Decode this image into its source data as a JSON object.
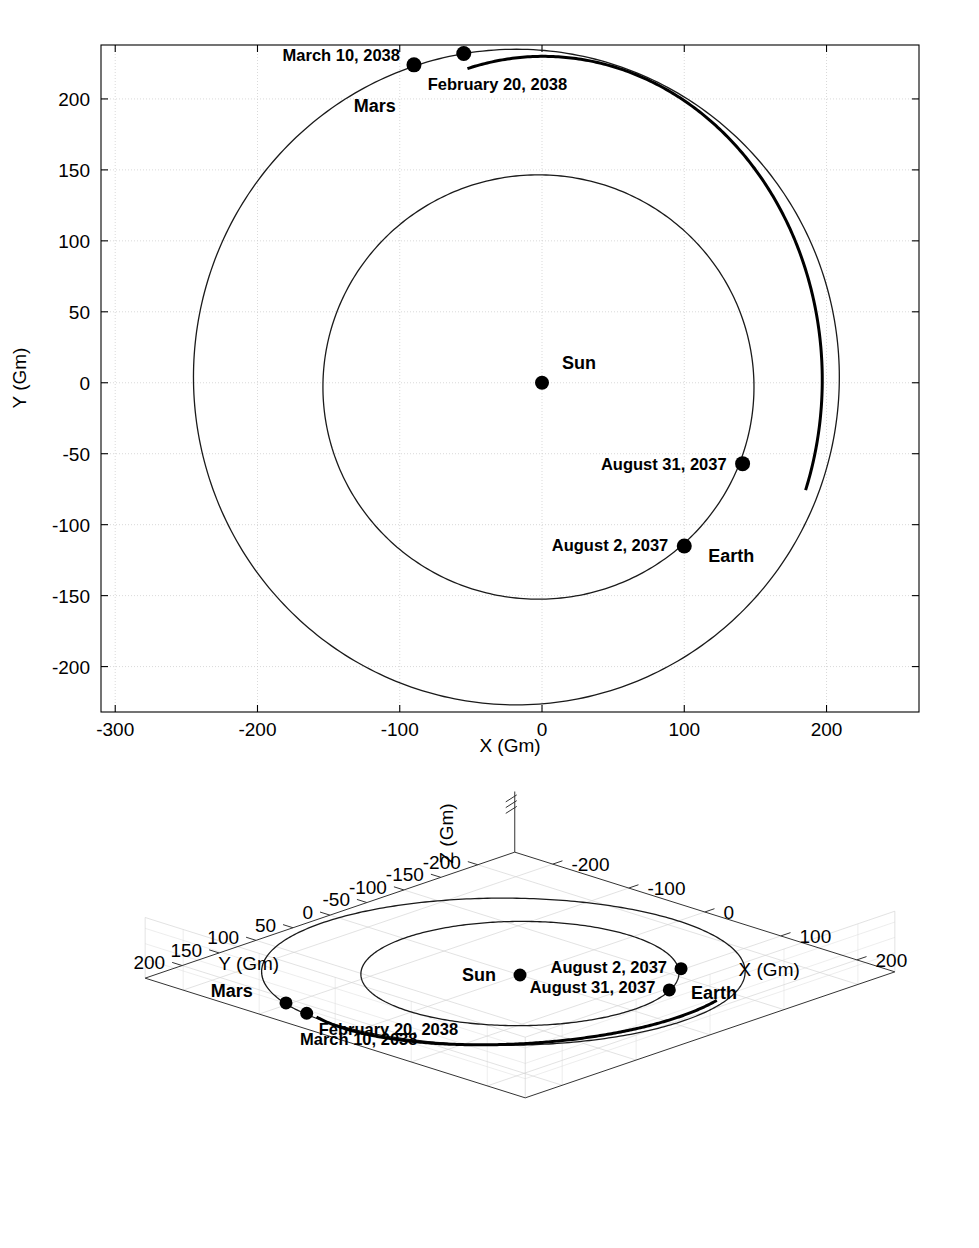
{
  "figure": {
    "background": "#ffffff",
    "line_color": "#1a1a1a",
    "grid_color": "#c8c8c8"
  },
  "chart_data": [
    {
      "id": "top-plot",
      "type": "scatter",
      "view": "2d-xy",
      "title": "",
      "xlabel": "X (Gm)",
      "ylabel": "Y (Gm)",
      "xlim": [
        -310,
        265
      ],
      "ylim": [
        -232,
        238
      ],
      "xticks": [
        -300,
        -200,
        -100,
        0,
        100,
        200
      ],
      "yticks": [
        200,
        150,
        100,
        50,
        0,
        -50,
        -100,
        -150,
        -200
      ],
      "xticklabels": [
        "-300",
        "-200",
        "-100",
        "0",
        "100",
        "200"
      ],
      "yticklabels": [
        "200",
        "150",
        "100",
        "50",
        "0",
        "-50",
        "-100",
        "-150",
        "-200"
      ],
      "grid": true,
      "legend": "none",
      "series": [
        {
          "name": "Earth orbit",
          "kind": "ellipse",
          "center": [
            -2.5,
            -3.0
          ],
          "semi_major": 151.5,
          "semi_minor": 149.5,
          "rotation_deg": 0
        },
        {
          "name": "Mars orbit",
          "kind": "ellipse",
          "center": [
            -18.0,
            4.0
          ],
          "semi_major": 227.0,
          "semi_minor": 231.0,
          "rotation_deg": 0
        },
        {
          "name": "Transfer trajectory",
          "kind": "arc",
          "from_point": [
            141,
            -57
          ],
          "to_point": [
            -55,
            232
          ],
          "note": "heavy line from August 31, 2037 to February 20, 2038"
        }
      ],
      "points": [
        {
          "label": "Sun",
          "x": 0,
          "y": 0,
          "label_dx": 30,
          "label_dy": -16,
          "bold": true,
          "size": "big"
        },
        {
          "label": "Earth",
          "x": 100,
          "y": -115,
          "label_dx": 28,
          "label_dy": 16,
          "bold": true,
          "size": "big"
        },
        {
          "label": "Mars",
          "x": -55,
          "y": 232,
          "label_dx": -115,
          "label_dy": 50,
          "bold": true,
          "size": "big"
        }
      ],
      "annotations": [
        {
          "text": "March 10, 2038",
          "x": -90,
          "y": 224,
          "anchor": "end",
          "dx": -12,
          "dy": -10
        },
        {
          "text": "February 20, 2038",
          "x": -55,
          "y": 232,
          "anchor": "start",
          "dx": -30,
          "dy": 38
        },
        {
          "text": "August 31, 2037",
          "x": 141,
          "y": -57,
          "anchor": "end",
          "dx": -12,
          "dy": 6
        },
        {
          "text": "August 2, 2037",
          "x": 100,
          "y": -115,
          "anchor": "end",
          "dx": -12,
          "dy": 6
        }
      ],
      "event_markers": [
        {
          "label": "March 10, 2038",
          "x": -90,
          "y": 224
        },
        {
          "label": "February 20, 2038",
          "x": -55,
          "y": 232
        },
        {
          "label": "August 31, 2037",
          "x": 141,
          "y": -57
        },
        {
          "label": "August 2, 2037",
          "x": 100,
          "y": -115
        }
      ]
    },
    {
      "id": "bottom-plot",
      "type": "scatter",
      "view": "3d-xyz",
      "title": "",
      "xlabel": "X (Gm)",
      "ylabel": "Y (Gm)",
      "zlabel": "Z (Gm)",
      "xticks": [
        -200,
        -100,
        0,
        100,
        200
      ],
      "xticklabels": [
        "-200",
        "-100",
        "0",
        "100",
        "200"
      ],
      "yticks": [
        200,
        150,
        100,
        50,
        0,
        -50,
        -100,
        -150,
        -200
      ],
      "yticklabels": [
        "200",
        "150",
        "100",
        "50",
        "0",
        "-50",
        "-100",
        "-150",
        "-200"
      ],
      "zticks": [],
      "zticklabels": [],
      "grid": true,
      "legend": "none",
      "series": [
        {
          "name": "Earth orbit",
          "kind": "ellipse-projected"
        },
        {
          "name": "Mars orbit",
          "kind": "ellipse-projected"
        },
        {
          "name": "Transfer trajectory",
          "kind": "arc-projected"
        }
      ],
      "points": [
        {
          "label": "Sun",
          "bold": true
        },
        {
          "label": "Earth",
          "bold": true
        },
        {
          "label": "Mars",
          "bold": true
        }
      ],
      "annotations": [
        {
          "text": "February 20, 2038"
        },
        {
          "text": "March 10, 2038"
        },
        {
          "text": "August 31, 2037"
        },
        {
          "text": "August 2, 2037"
        }
      ]
    }
  ],
  "top": {
    "xlabel": "X (Gm)",
    "ylabel": "Y (Gm)",
    "labels": {
      "sun": "Sun",
      "earth": "Earth",
      "mars": "Mars",
      "march10": "March 10, 2038",
      "feb20": "February 20, 2038",
      "aug31": "August 31, 2037",
      "aug2": "August 2, 2037"
    },
    "xticks": [
      "-300",
      "-200",
      "-100",
      "0",
      "100",
      "200"
    ],
    "yticks": [
      "200",
      "150",
      "100",
      "50",
      "0",
      "-50",
      "-100",
      "-150",
      "-200"
    ]
  },
  "bottom": {
    "xlabel": "X (Gm)",
    "ylabel": "Y (Gm)",
    "zlabel": "Z (Gm)",
    "labels": {
      "sun": "Sun",
      "earth": "Earth",
      "mars": "Mars",
      "march10": "March 10, 2038",
      "feb20": "February 20, 2038",
      "aug31": "August 31, 2037",
      "aug2": "August 2, 2037"
    },
    "xticks": [
      "-200",
      "-100",
      "0",
      "100",
      "200"
    ],
    "yticks": [
      "200",
      "150",
      "100",
      "50",
      "0",
      "-50",
      "-100",
      "-150",
      "-200"
    ]
  }
}
